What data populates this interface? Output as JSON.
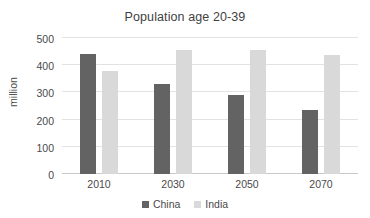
{
  "chart_data": {
    "type": "bar",
    "title": "Population age 20-39",
    "xlabel": "",
    "ylabel": "million",
    "categories": [
      "2010",
      "2030",
      "2050",
      "2070"
    ],
    "series": [
      {
        "name": "China",
        "color": "#636363",
        "values": [
          440,
          330,
          290,
          235
        ]
      },
      {
        "name": "India",
        "color": "#d9d9d9",
        "values": [
          380,
          455,
          455,
          437
        ]
      }
    ],
    "ylim": [
      0,
      500
    ],
    "yticks": [
      0,
      100,
      200,
      300,
      400,
      500
    ],
    "ytick_labels": [
      "0",
      "100",
      "200",
      "300",
      "400",
      "500"
    ],
    "grid": true,
    "legend_position": "bottom"
  },
  "legend": {
    "items": [
      {
        "label": "China",
        "color": "#636363"
      },
      {
        "label": "India",
        "color": "#d9d9d9"
      }
    ]
  }
}
